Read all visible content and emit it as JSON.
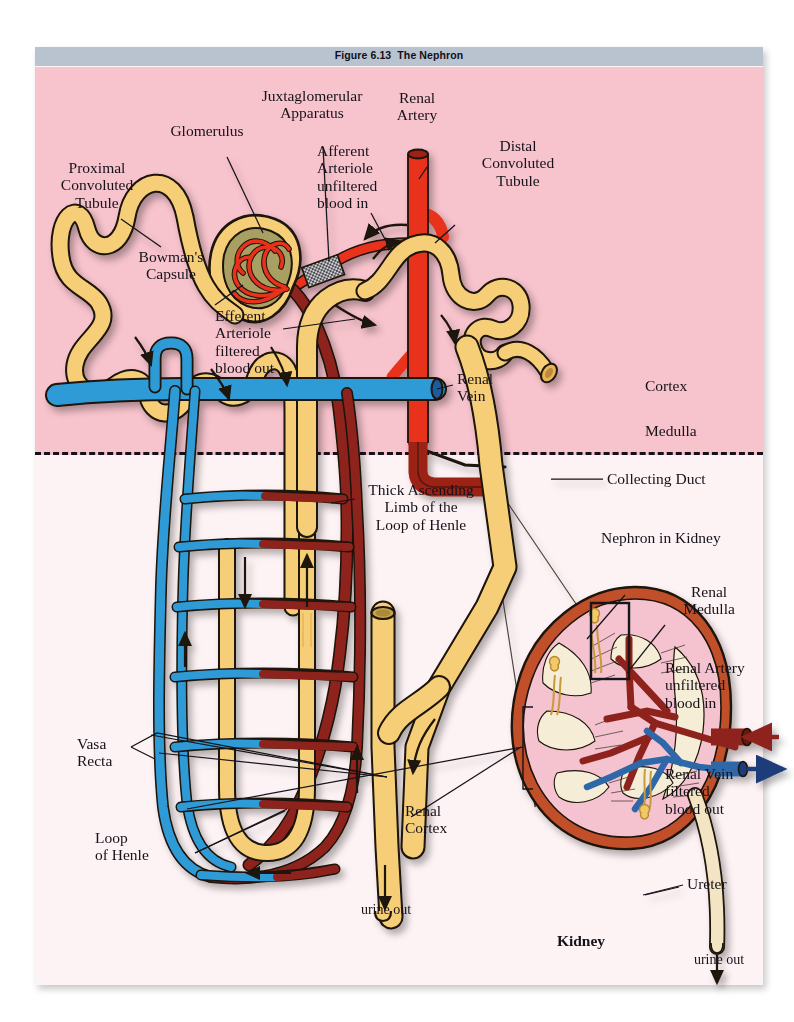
{
  "figure": {
    "number": "Figure 6.13",
    "title": "The Nephron",
    "titlebar_color": "#b9c2cf"
  },
  "regions": {
    "cortex": {
      "label": "Cortex",
      "color": "#f7c3cd"
    },
    "medulla": {
      "label": "Medulla",
      "color": "#fdf2f4"
    }
  },
  "labels": {
    "proximal_convoluted_tubule": "Proximal\nConvoluted\nTubule",
    "glomerulus": "Glomerulus",
    "bowmans_capsule": "Bowman's\nCapsule",
    "juxtaglomerular_apparatus": "Juxtaglomerular\nApparatus",
    "afferent_arteriole": "Afferent\nArteriole\nunfiltered\nblood in",
    "renal_artery": "Renal\nArtery",
    "distal_convoluted_tubule": "Distal\nConvoluted\nTubule",
    "efferent_arteriole": "Efferent\nArteriole\nfiltered\nblood out",
    "renal_vein": "Renal\nVein",
    "cortex": "Cortex",
    "medulla": "Medulla",
    "thick_ascending_limb": "Thick Ascending\nLimb of the\nLoop of Henle",
    "collecting_duct": "Collecting Duct",
    "nephron_in_kidney": "Nephron in Kidney",
    "renal_medulla": "Renal\nMedulla",
    "kidney_renal_artery": "Renal Artery\nunfiltered\nblood in",
    "kidney_renal_vein": "Renal Vein\nfiltered\nblood out",
    "vasa_recta": "Vasa\nRecta",
    "loop_of_henle": "Loop\nof Henle",
    "renal_cortex": "Renal\nCortex",
    "ureter": "Ureter",
    "kidney_caption": "Kidney",
    "urine_out_nephron": "urine out",
    "urine_out_kidney": "urine out"
  },
  "palette": {
    "tubule_yellow": "#f5ce77",
    "tubule_yellow_dark": "#e8b355",
    "artery_red": "#e8321c",
    "artery_dark_red": "#9c2018",
    "vein_blue": "#2e9bd6",
    "vein_dark_blue": "#1d5c9e",
    "bowman_space": "#a8a064",
    "outline": "#1b1208",
    "kidney_capsule": "#c0502c",
    "kidney_cortex_pink": "#f4c3cf",
    "kidney_pyramid_cream": "#f6edd7",
    "callout_cone": "#f3ecd6"
  }
}
